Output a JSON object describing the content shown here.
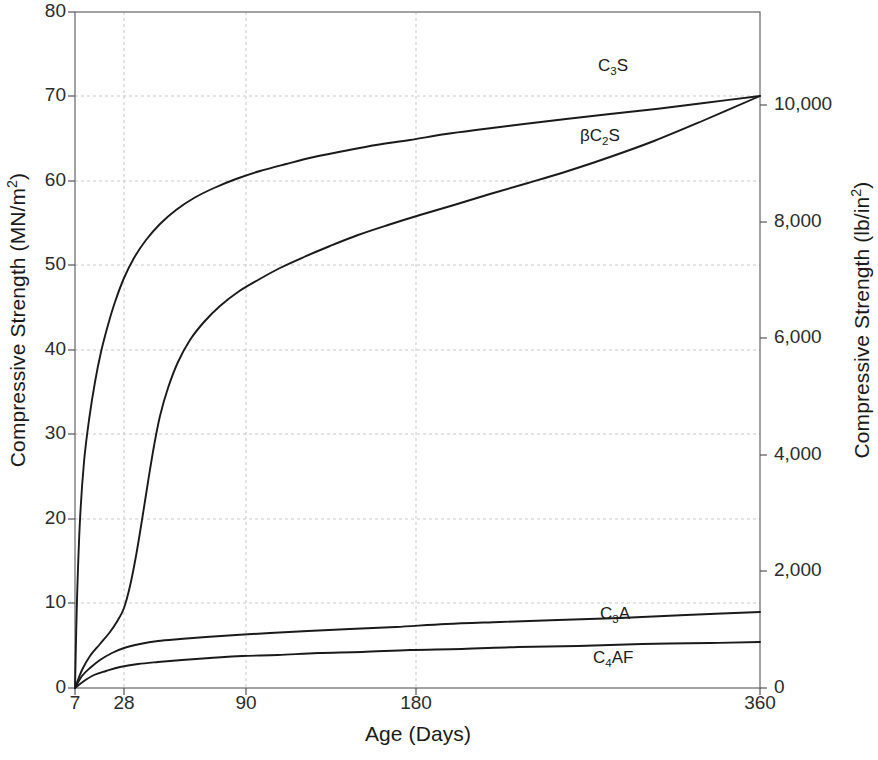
{
  "chart_data": {
    "type": "line",
    "title": "",
    "xlabel": "Age (Days)",
    "ylabel": "Compressive Strength (MN/m²)",
    "ylabel_right": "Compressive Strength (lb/in²)",
    "x_tick_labels": [
      "7",
      "28",
      "90",
      "180",
      "360"
    ],
    "x_tick_values": [
      7,
      28,
      90,
      180,
      360
    ],
    "x_tick_positions_px": [
      75,
      124,
      246,
      416,
      760
    ],
    "xlim": [
      7,
      360
    ],
    "x_scale": "non-linear (compressed age scale)",
    "y_tick_labels": [
      "0",
      "10",
      "20",
      "30",
      "40",
      "50",
      "60",
      "70",
      "80"
    ],
    "y_tick_values": [
      0,
      10,
      20,
      30,
      40,
      50,
      60,
      70,
      80
    ],
    "ylim": [
      0,
      80
    ],
    "y_right_tick_labels": [
      "0",
      "2,000",
      "4,000",
      "6,000",
      "8,000",
      "10,000"
    ],
    "y_right_tick_values": [
      0,
      2000,
      4000,
      6000,
      8000,
      10000
    ],
    "ylim_right": [
      0,
      11600
    ],
    "grid": true,
    "grid_style": "dashed light gray",
    "legend": "inline curve labels",
    "line_color": "#1a1a1a",
    "grid_color": "#c9c9c9",
    "axis_color": "#555555",
    "background": "#ffffff",
    "series": [
      {
        "name": "C₃S",
        "label_html": "C<span class=\"sub\">3</span>S",
        "label_x_px": 598,
        "label_y_px": 56,
        "points": [
          [
            75,
            688
          ],
          [
            77,
            600
          ],
          [
            80,
            520
          ],
          [
            84,
            462
          ],
          [
            89,
            420
          ],
          [
            95,
            382
          ],
          [
            101,
            352
          ],
          [
            108,
            325
          ],
          [
            115,
            302
          ],
          [
            124,
            278
          ],
          [
            134,
            258
          ],
          [
            146,
            240
          ],
          [
            160,
            224
          ],
          [
            176,
            210
          ],
          [
            194,
            198
          ],
          [
            214,
            188
          ],
          [
            236,
            179
          ],
          [
            260,
            171
          ],
          [
            286,
            164
          ],
          [
            314,
            157
          ],
          [
            344,
            151
          ],
          [
            376,
            145
          ],
          [
            410,
            140
          ],
          [
            446,
            134
          ],
          [
            484,
            129
          ],
          [
            524,
            124
          ],
          [
            566,
            119
          ],
          [
            610,
            114
          ],
          [
            656,
            109
          ],
          [
            704,
            103
          ],
          [
            760,
            96
          ]
        ],
        "values_mn_m2": {
          "7": 0,
          "14": 30,
          "21": 42,
          "28": 48.5,
          "45": 56,
          "60": 59.5,
          "90": 63.5,
          "120": 65.5,
          "180": 68,
          "270": 70.2,
          "360": 72
        },
        "final_value_mn_m2": 72
      },
      {
        "name": "βC₂S",
        "label_html": "βC<span class=\"sub\">2</span>S",
        "label_x_px": 580,
        "label_y_px": 126,
        "points": [
          [
            75,
            688
          ],
          [
            82,
            670
          ],
          [
            90,
            656
          ],
          [
            100,
            644
          ],
          [
            110,
            632
          ],
          [
            118,
            620
          ],
          [
            124,
            608
          ],
          [
            130,
            586
          ],
          [
            136,
            556
          ],
          [
            142,
            520
          ],
          [
            148,
            482
          ],
          [
            154,
            446
          ],
          [
            160,
            416
          ],
          [
            168,
            388
          ],
          [
            178,
            362
          ],
          [
            190,
            340
          ],
          [
            204,
            322
          ],
          [
            220,
            306
          ],
          [
            238,
            292
          ],
          [
            258,
            280
          ],
          [
            280,
            268
          ],
          [
            304,
            257
          ],
          [
            330,
            246
          ],
          [
            358,
            235
          ],
          [
            388,
            225
          ],
          [
            420,
            215
          ],
          [
            454,
            205
          ],
          [
            490,
            194
          ],
          [
            528,
            183
          ],
          [
            568,
            171
          ],
          [
            610,
            157
          ],
          [
            654,
            141
          ],
          [
            700,
            122
          ],
          [
            760,
            96
          ]
        ],
        "values_mn_m2": {
          "7": 0,
          "21": 3,
          "28": 5,
          "35": 18,
          "40": 26,
          "50": 32,
          "60": 36,
          "90": 41.5,
          "120": 46,
          "180": 52,
          "270": 61,
          "360": 72
        },
        "final_value_mn_m2": 72
      },
      {
        "name": "C₃A",
        "label_html": "C<span class=\"sub\">3</span>A",
        "label_x_px": 600,
        "label_y_px": 604,
        "points": [
          [
            75,
            688
          ],
          [
            82,
            676
          ],
          [
            90,
            668
          ],
          [
            100,
            660
          ],
          [
            112,
            653
          ],
          [
            124,
            648
          ],
          [
            140,
            644
          ],
          [
            158,
            641
          ],
          [
            180,
            639
          ],
          [
            206,
            637
          ],
          [
            236,
            635
          ],
          [
            270,
            633
          ],
          [
            308,
            631
          ],
          [
            350,
            629
          ],
          [
            396,
            627
          ],
          [
            446,
            624
          ],
          [
            500,
            622
          ],
          [
            558,
            620
          ],
          [
            620,
            618
          ],
          [
            686,
            615
          ],
          [
            760,
            612
          ]
        ],
        "values_mn_m2": {
          "7": 0,
          "14": 2.4,
          "28": 4.8,
          "90": 5.6,
          "180": 6.5,
          "270": 7.1,
          "360": 7.8
        },
        "final_value_mn_m2": 7.8
      },
      {
        "name": "C₄AF",
        "label_html": "C<span class=\"sub\">4</span>AF",
        "label_x_px": 593,
        "label_y_px": 648,
        "points": [
          [
            75,
            688
          ],
          [
            84,
            681
          ],
          [
            94,
            675
          ],
          [
            106,
            671
          ],
          [
            120,
            667
          ],
          [
            138,
            664
          ],
          [
            158,
            662
          ],
          [
            182,
            660
          ],
          [
            210,
            658
          ],
          [
            242,
            656
          ],
          [
            278,
            655
          ],
          [
            318,
            653
          ],
          [
            362,
            652
          ],
          [
            410,
            650
          ],
          [
            462,
            649
          ],
          [
            518,
            647
          ],
          [
            578,
            646
          ],
          [
            642,
            644
          ],
          [
            710,
            643
          ],
          [
            760,
            642
          ]
        ],
        "values_mn_m2": {
          "7": 0,
          "14": 1.6,
          "28": 3.0,
          "90": 4.0,
          "180": 4.6,
          "270": 5.0,
          "360": 5.4
        },
        "final_value_mn_m2": 5.4
      }
    ]
  },
  "axes": {
    "left_title": "Compressive Strength (MN/m",
    "left_title_sup": "2",
    "left_title_tail": ")",
    "right_title": "Compressive Strength (lb/in",
    "right_title_sup": "2",
    "right_title_tail": ")",
    "x_title": "Age (Days)"
  },
  "y_ticks_left": [
    {
      "label": "80",
      "y": 12
    },
    {
      "label": "70",
      "y": 96
    },
    {
      "label": "60",
      "y": 181
    },
    {
      "label": "50",
      "y": 265
    },
    {
      "label": "40",
      "y": 350
    },
    {
      "label": "30",
      "y": 434
    },
    {
      "label": "20",
      "y": 519
    },
    {
      "label": "10",
      "y": 603
    },
    {
      "label": "0",
      "y": 688
    }
  ],
  "y_ticks_right": [
    {
      "label": "10,000",
      "y": 105
    },
    {
      "label": "8,000",
      "y": 222
    },
    {
      "label": "6,000",
      "y": 338
    },
    {
      "label": "4,000",
      "y": 455
    },
    {
      "label": "2,000",
      "y": 571
    },
    {
      "label": "0",
      "y": 688
    }
  ],
  "x_ticks": [
    {
      "label": "7",
      "x": 75
    },
    {
      "label": "28",
      "x": 124
    },
    {
      "label": "90",
      "x": 246
    },
    {
      "label": "180",
      "x": 416
    },
    {
      "label": "360",
      "x": 760
    }
  ]
}
